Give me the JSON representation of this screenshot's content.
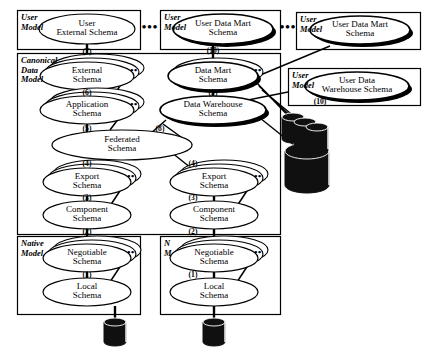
{
  "figure": {
    "type": "layered-schema-architecture-diagram"
  },
  "colors": {
    "line": "#000000",
    "fill": "#ffffff",
    "shadow": "#000000",
    "cylinder": "#101010",
    "background": "#ffffff"
  },
  "containers": [
    {
      "id": "user-model-1",
      "label_line1": "User",
      "label_line2": "Model",
      "x": 17,
      "y": 10,
      "w": 123,
      "h": 39
    },
    {
      "id": "user-model-2",
      "label_line1": "User",
      "label_line2": "Model",
      "x": 160,
      "y": 10,
      "w": 120,
      "h": 39
    },
    {
      "id": "user-model-3",
      "label_line1": "User",
      "label_line2": "Model",
      "x": 296,
      "y": 12,
      "w": 124,
      "h": 37
    },
    {
      "id": "user-model-4",
      "label_line1": "User",
      "label_line2": "Model",
      "x": 288,
      "y": 68,
      "w": 132,
      "h": 37
    },
    {
      "id": "canonical-data-model",
      "label_line1": "Canonical",
      "label_line2": "Data",
      "label_line3": "Model",
      "x": 17,
      "y": 53,
      "w": 263,
      "h": 181
    },
    {
      "id": "native-model-left",
      "label_line1": "Native",
      "label_line2": "Model",
      "x": 17,
      "y": 236,
      "w": 123,
      "h": 78
    },
    {
      "id": "native-model-right",
      "label_line1": "N",
      "label_line2": "M",
      "x": 160,
      "y": 236,
      "w": 120,
      "h": 78
    }
  ],
  "nodes": [
    {
      "id": "user-external-schema",
      "line1": "User",
      "line2": "External Schema",
      "cx": 87,
      "cy": 29,
      "rx": 48,
      "ry": 15,
      "stack": 1,
      "shadow": false,
      "dots": false,
      "small": false
    },
    {
      "id": "user-data-mart-schema-1",
      "line1": "User Data Mart",
      "line2": "Schema",
      "cx": 223,
      "cy": 29,
      "rx": 50,
      "ry": 15,
      "stack": 1,
      "shadow": true,
      "dots": false,
      "small": false
    },
    {
      "id": "user-data-mart-schema-2",
      "line1": "User Data Mart",
      "line2": "Schema",
      "cx": 360,
      "cy": 30,
      "rx": 50,
      "ry": 14,
      "stack": 1,
      "shadow": true,
      "dots": false,
      "small": false
    },
    {
      "id": "user-data-warehouse-schema",
      "line1": "User Data",
      "line2": "Warehouse Schema",
      "cx": 357,
      "cy": 86,
      "rx": 52,
      "ry": 14,
      "stack": 1,
      "shadow": true,
      "dots": false,
      "small": false
    },
    {
      "id": "external-schema",
      "line1": "External",
      "line2": "Schema",
      "cx": 87,
      "cy": 76,
      "rx": 47,
      "ry": 14,
      "stack": 3,
      "shadow": false,
      "dots": true,
      "small": false
    },
    {
      "id": "application-schema",
      "line1": "Application",
      "line2": "Schema",
      "cx": 87,
      "cy": 110,
      "rx": 47,
      "ry": 14,
      "stack": 3,
      "shadow": false,
      "dots": true,
      "small": false
    },
    {
      "id": "federated-schema",
      "line1": "Federated",
      "line2": "Schema",
      "cx": 122,
      "cy": 145,
      "rx": 70,
      "ry": 15,
      "stack": 1,
      "shadow": false,
      "dots": false,
      "small": false
    },
    {
      "id": "export-schema-left",
      "line1": "Export",
      "line2": "Schema",
      "cx": 87,
      "cy": 182,
      "rx": 44,
      "ry": 14,
      "stack": 3,
      "shadow": false,
      "dots": true,
      "small": false
    },
    {
      "id": "component-schema-left",
      "line1": "Component",
      "line2": "Schema",
      "cx": 87,
      "cy": 215,
      "rx": 44,
      "ry": 14,
      "stack": 1,
      "shadow": false,
      "dots": false,
      "small": false
    },
    {
      "id": "negotiable-schema-left",
      "line1": "Negotiable",
      "line2": "Schema",
      "cx": 87,
      "cy": 258,
      "rx": 44,
      "ry": 14,
      "stack": 3,
      "shadow": false,
      "dots": true,
      "small": false
    },
    {
      "id": "local-schema-left",
      "line1": "Local",
      "line2": "Schema",
      "cx": 87,
      "cy": 292,
      "rx": 44,
      "ry": 14,
      "stack": 1,
      "shadow": false,
      "dots": false,
      "small": false
    },
    {
      "id": "data-mart-schema",
      "line1": "Data Mart",
      "line2": "Schema",
      "cx": 213,
      "cy": 76,
      "rx": 45,
      "ry": 14,
      "stack": 2,
      "shadow": true,
      "dots": true,
      "small": false
    },
    {
      "id": "data-warehouse-schema",
      "line1": "Data Warehouse",
      "line2": "Schema",
      "cx": 213,
      "cy": 110,
      "rx": 53,
      "ry": 14,
      "stack": 1,
      "shadow": true,
      "dots": false,
      "small": false
    },
    {
      "id": "export-schema-right",
      "line1": "Export",
      "line2": "Schema",
      "cx": 214,
      "cy": 182,
      "rx": 44,
      "ry": 14,
      "stack": 3,
      "shadow": false,
      "dots": true,
      "small": false
    },
    {
      "id": "component-schema-right",
      "line1": "Component",
      "line2": "Schema",
      "cx": 214,
      "cy": 215,
      "rx": 44,
      "ry": 14,
      "stack": 1,
      "shadow": false,
      "dots": false,
      "small": false
    },
    {
      "id": "negotiable-schema-right",
      "line1": "Negotiable",
      "line2": "Schema",
      "cx": 214,
      "cy": 258,
      "rx": 44,
      "ry": 14,
      "stack": 3,
      "shadow": false,
      "dots": true,
      "small": false
    },
    {
      "id": "local-schema-right",
      "line1": "Local",
      "line2": "Schema",
      "cx": 214,
      "cy": 292,
      "rx": 44,
      "ry": 14,
      "stack": 1,
      "shadow": false,
      "dots": false,
      "small": false
    }
  ],
  "step_labels": [
    {
      "id": "step-7",
      "text": "(7)",
      "x": 87,
      "y": 53
    },
    {
      "id": "step-10-mart",
      "text": "(10)",
      "x": 213,
      "y": 52
    },
    {
      "id": "step-10-warehouse",
      "text": "(10)",
      "x": 320,
      "y": 103
    },
    {
      "id": "step-6",
      "text": "(6)",
      "x": 87,
      "y": 94
    },
    {
      "id": "step-9",
      "text": "(9)",
      "x": 213,
      "y": 94
    },
    {
      "id": "step-5",
      "text": "(5)",
      "x": 87,
      "y": 130
    },
    {
      "id": "step-8",
      "text": "(8)",
      "x": 160,
      "y": 130
    },
    {
      "id": "step-4-left",
      "text": "(4)",
      "x": 87,
      "y": 165
    },
    {
      "id": "step-4-right",
      "text": "(4)",
      "x": 193,
      "y": 165
    },
    {
      "id": "step-3-left",
      "text": "(3)",
      "x": 87,
      "y": 199
    },
    {
      "id": "step-3-right",
      "text": "(3)",
      "x": 193,
      "y": 199
    },
    {
      "id": "step-2-left",
      "text": "(2)",
      "x": 87,
      "y": 233
    },
    {
      "id": "step-2-right",
      "text": "(2)",
      "x": 193,
      "y": 233
    },
    {
      "id": "step-1-left",
      "text": "(1)",
      "x": 87,
      "y": 276
    },
    {
      "id": "step-1-right",
      "text": "(1)",
      "x": 193,
      "y": 276
    }
  ],
  "ellipsis_markers": [
    {
      "id": "ellipsis-between-user-model-1-2",
      "text": "•••",
      "x": 150,
      "y": 29
    },
    {
      "id": "ellipsis-between-user-model-2-3",
      "text": "•••",
      "x": 288,
      "y": 29
    }
  ],
  "cylinders": [
    {
      "id": "db-cylinder-left",
      "cx": 115,
      "cy": 332,
      "rx": 11,
      "ry": 4,
      "h": 20
    },
    {
      "id": "db-cylinder-right",
      "cx": 214,
      "cy": 332,
      "rx": 11,
      "ry": 4,
      "h": 20
    },
    {
      "id": "db-cylinder-warehouse",
      "cx": 307,
      "cy": 168,
      "rx": 22,
      "ry": 8,
      "h": 34
    },
    {
      "id": "db-cylinder-mart-a",
      "cx": 293,
      "cy": 128,
      "rx": 11,
      "ry": 4,
      "h": 22
    },
    {
      "id": "db-cylinder-mart-b",
      "cx": 305,
      "cy": 133,
      "rx": 11,
      "ry": 4,
      "h": 22
    },
    {
      "id": "db-cylinder-mart-c",
      "cx": 317,
      "cy": 138,
      "rx": 11,
      "ry": 4,
      "h": 22
    }
  ],
  "connectors": {
    "vertical_count": 15,
    "diagonal_count": 12,
    "description": "Vertical trunk lines join each stacked schema level; diagonal lines link data mart / warehouse schemas to their user schemas and to the database cylinders."
  }
}
